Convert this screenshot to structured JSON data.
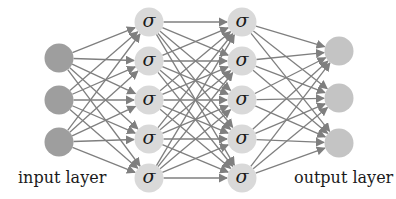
{
  "diagram": {
    "colors": {
      "input_node": "#9e9e9e",
      "hidden_node": "#d9d9d9",
      "output_node": "#c4c4c4",
      "edge": "#7f7f7f",
      "text": "#1a1a1a"
    },
    "node_radius": 14.5,
    "layers": [
      {
        "name": "input",
        "label": "input layer",
        "x": 59,
        "ys": [
          58,
          100,
          142
        ],
        "node_text": "",
        "fill_key": "input_node"
      },
      {
        "name": "hidden-1",
        "label": "",
        "x": 149,
        "ys": [
          22,
          61,
          100,
          139,
          178
        ],
        "node_text": "σ",
        "fill_key": "hidden_node"
      },
      {
        "name": "hidden-2",
        "label": "",
        "x": 242,
        "ys": [
          22,
          61,
          100,
          139,
          178
        ],
        "node_text": "σ",
        "fill_key": "hidden_node"
      },
      {
        "name": "output",
        "label": "output layer",
        "x": 339,
        "ys": [
          51,
          98,
          143
        ],
        "node_text": "",
        "fill_key": "output_node"
      }
    ],
    "connectivity": "fully-connected",
    "labels": {
      "input": "input layer",
      "output": "output layer"
    }
  }
}
